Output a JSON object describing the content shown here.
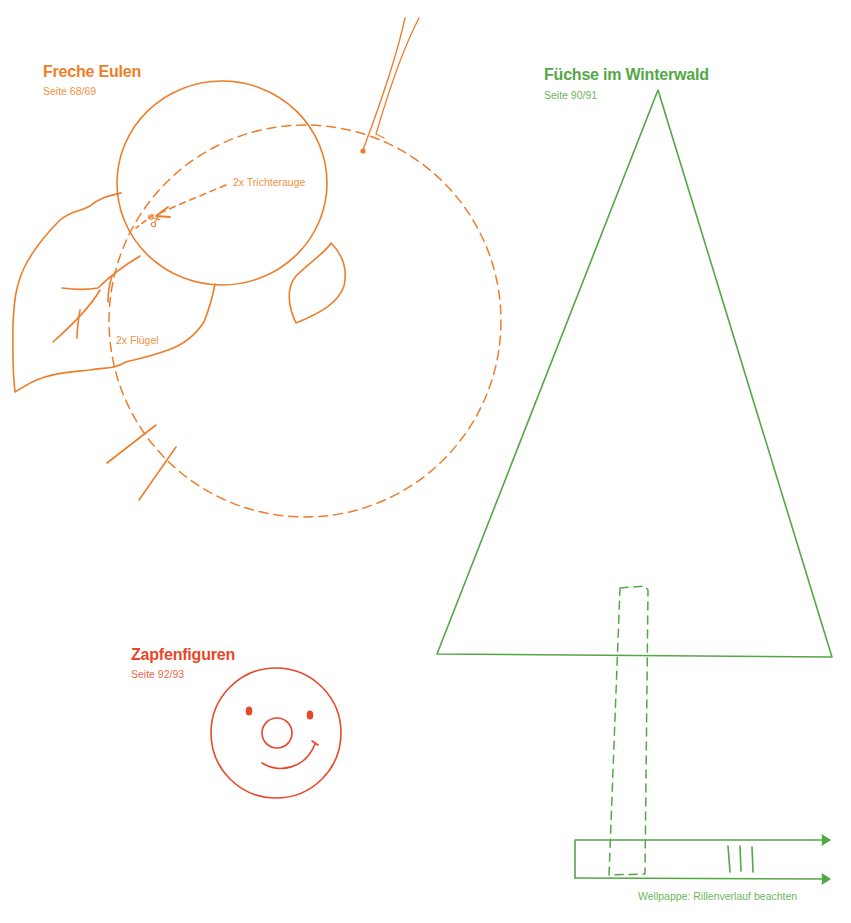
{
  "colors": {
    "orange": "#ee7d2a",
    "green": "#52a845",
    "red": "#e8472a"
  },
  "sections": {
    "eulen": {
      "title": "Freche Eulen",
      "page": "Seite 68/69",
      "annotations": {
        "eye": "2x Trichterauge",
        "wing": "2x Flügel"
      },
      "icons": [
        "scissors-icon"
      ]
    },
    "fuechse": {
      "title": "Füchse im Winterwald",
      "page": "Seite 90/91",
      "annotations": {
        "cardboard": "Wellpappe: Rillenverlauf beachten"
      }
    },
    "zapfen": {
      "title": "Zapfenfiguren",
      "page": "Seite 92/93"
    }
  }
}
